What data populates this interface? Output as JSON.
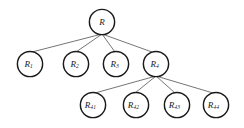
{
  "diagram": {
    "type": "tree",
    "title": "",
    "background_color": "#ffffff",
    "node_fill": "#ffffff",
    "node_stroke": "#1a1a1a",
    "edge_color": "#3a3a3a",
    "node_radius": 12.6,
    "levels": 3,
    "nodes": [
      {
        "id": "R",
        "base": "R",
        "sub": "",
        "cx": 102,
        "cy": 22,
        "level": 0
      },
      {
        "id": "R1",
        "base": "R",
        "sub": "1",
        "cx": 30,
        "cy": 64,
        "level": 1
      },
      {
        "id": "R2",
        "base": "R",
        "sub": "2",
        "cx": 76,
        "cy": 64,
        "level": 1
      },
      {
        "id": "R3",
        "base": "R",
        "sub": "3",
        "cx": 116,
        "cy": 64,
        "level": 1
      },
      {
        "id": "R4",
        "base": "R",
        "sub": "4",
        "cx": 156,
        "cy": 64,
        "level": 1
      },
      {
        "id": "R41",
        "base": "R",
        "sub": "41",
        "cx": 93,
        "cy": 105,
        "level": 2
      },
      {
        "id": "R42",
        "base": "R",
        "sub": "42",
        "cx": 136,
        "cy": 105,
        "level": 2
      },
      {
        "id": "R43",
        "base": "R",
        "sub": "43",
        "cx": 177,
        "cy": 105,
        "level": 2
      },
      {
        "id": "R44",
        "base": "R",
        "sub": "44",
        "cx": 216,
        "cy": 105,
        "level": 2
      }
    ],
    "edges": [
      {
        "from": "R",
        "to": "R1",
        "x1": 102,
        "y1": 34,
        "x2": 32,
        "y2": 52
      },
      {
        "from": "R",
        "to": "R2",
        "x1": 102,
        "y1": 34,
        "x2": 76,
        "y2": 52
      },
      {
        "from": "R",
        "to": "R3",
        "x1": 102,
        "y1": 34,
        "x2": 115,
        "y2": 52
      },
      {
        "from": "R",
        "to": "R4",
        "x1": 102,
        "y1": 34,
        "x2": 152,
        "y2": 52
      },
      {
        "from": "R4",
        "to": "R41",
        "x1": 156,
        "y1": 76,
        "x2": 95,
        "y2": 93
      },
      {
        "from": "R4",
        "to": "R42",
        "x1": 156,
        "y1": 76,
        "x2": 135,
        "y2": 93
      },
      {
        "from": "R4",
        "to": "R43",
        "x1": 156,
        "y1": 76,
        "x2": 175,
        "y2": 93
      },
      {
        "from": "R4",
        "to": "R44",
        "x1": 156,
        "y1": 76,
        "x2": 213,
        "y2": 93
      }
    ]
  }
}
